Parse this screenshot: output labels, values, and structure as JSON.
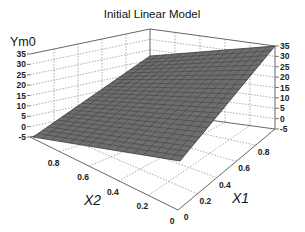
{
  "chart_data": {
    "type": "surface3d",
    "title": "Initial Linear Model",
    "zlabel": "Ym0",
    "xlabel": "X1",
    "ylabel": "X2",
    "z_ticks": [
      "35",
      "30",
      "25",
      "20",
      "15",
      "10",
      "5",
      "0",
      "-5"
    ],
    "x1_ticks": [
      "0",
      "0.2",
      "0.4",
      "0.6",
      "0.8"
    ],
    "x2_ticks": [
      "0",
      "0.2",
      "0.4",
      "0.6",
      "0.8"
    ],
    "zlim": [
      -5,
      35
    ],
    "x1lim": [
      0,
      1
    ],
    "x2lim": [
      0,
      1
    ],
    "grid": true,
    "surface": {
      "description": "Planar linear surface; rises from about -5 at X1=0 toward about 35 at X1=1, nearly flat in X2",
      "corners": [
        {
          "X1": 0,
          "X2": 0,
          "Y": -5
        },
        {
          "X1": 0,
          "X2": 1,
          "Y": -5
        },
        {
          "X1": 1,
          "X2": 1,
          "Y": 35
        },
        {
          "X1": 1,
          "X2": 0,
          "Y": 30
        }
      ],
      "mesh_color": "#6e6e6e",
      "line_color": "#3a3a3a"
    }
  }
}
